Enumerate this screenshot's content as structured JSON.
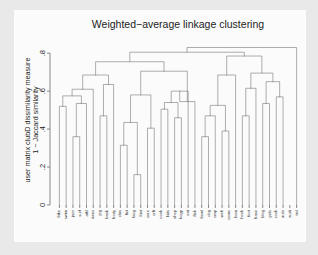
{
  "chart_data": {
    "type": "dendrogram",
    "title": "Weighted−average linkage clustering",
    "xlabel": "",
    "ylabel_line1": "user matrix clubD dissimilarity measure",
    "ylabel_line2": "1 − Jaccard similarity",
    "ylim": [
      0,
      0.88
    ],
    "yticks": [
      0,
      0.2,
      0.4,
      0.6,
      0.8
    ],
    "ytick_labels": [
      "0",
      ".2",
      ".4",
      ".6",
      ".8"
    ],
    "grid": false,
    "legend": "none",
    "leaf_count": 36,
    "leaf_labels": [
      "bike",
      "swim",
      "jazz",
      "surf",
      "athl",
      "danc",
      "jog",
      "bask",
      "body",
      "clas",
      "fict",
      "biog",
      "hist",
      "sore",
      "crft",
      "cook",
      "kids",
      "shop",
      "kogp",
      "eat",
      "fish",
      "bowl",
      "dog",
      "cmp",
      "web",
      "comc",
      "hom",
      "hock",
      "foot",
      "base",
      "blog",
      "polc",
      "rock",
      "auto",
      "audi",
      "trvl"
    ],
    "merges": [
      {
        "id": "m1",
        "left": "bike",
        "right": "swim",
        "height": 0.52
      },
      {
        "id": "m2",
        "left": "jazz",
        "right": "surf",
        "height": 0.36
      },
      {
        "id": "m3",
        "left": "m2",
        "right": "athl",
        "height": 0.535
      },
      {
        "id": "m4",
        "left": "m1",
        "right": "m3",
        "height": 0.575
      },
      {
        "id": "m5",
        "left": "m4",
        "right": "danc",
        "height": 0.61
      },
      {
        "id": "m6",
        "left": "jog",
        "right": "bask",
        "height": 0.47
      },
      {
        "id": "m7",
        "left": "m6",
        "right": "body",
        "height": 0.635
      },
      {
        "id": "m8",
        "left": "m5",
        "right": "m7",
        "height": 0.685
      },
      {
        "id": "m9",
        "left": "clas",
        "right": "fict",
        "height": 0.315
      },
      {
        "id": "m10",
        "left": "biog",
        "right": "hist",
        "height": 0.16
      },
      {
        "id": "m11",
        "left": "m9",
        "right": "m10",
        "height": 0.435
      },
      {
        "id": "m12",
        "left": "sore",
        "right": "crft",
        "height": 0.405
      },
      {
        "id": "m13",
        "left": "m11",
        "right": "m12",
        "height": 0.58
      },
      {
        "id": "m14",
        "left": "cook",
        "right": "kids",
        "height": 0.505
      },
      {
        "id": "m15",
        "left": "shop",
        "right": "kogp",
        "height": 0.46
      },
      {
        "id": "m16",
        "left": "m14",
        "right": "m15",
        "height": 0.54
      },
      {
        "id": "m17",
        "left": "m16",
        "right": "eat",
        "height": 0.6
      },
      {
        "id": "m18",
        "left": "m17",
        "right": "fish",
        "height": 0.545
      },
      {
        "id": "m19",
        "left": "m13",
        "right": "m18",
        "height": 0.705
      },
      {
        "id": "m20",
        "left": "m8",
        "right": "m19",
        "height": 0.755
      },
      {
        "id": "m21",
        "left": "bowl",
        "right": "dog",
        "height": 0.36
      },
      {
        "id": "m22",
        "left": "m21",
        "right": "cmp",
        "height": 0.47
      },
      {
        "id": "m23",
        "left": "web",
        "right": "comc",
        "height": 0.39
      },
      {
        "id": "m24",
        "left": "m22",
        "right": "m23",
        "height": 0.525
      },
      {
        "id": "m25",
        "left": "m24",
        "right": "hom",
        "height": 0.685
      },
      {
        "id": "m26",
        "left": "hock",
        "right": "foot",
        "height": 0.47
      },
      {
        "id": "m27",
        "left": "m26",
        "right": "base",
        "height": 0.615
      },
      {
        "id": "m28",
        "left": "blog",
        "right": "polc",
        "height": 0.535
      },
      {
        "id": "m29",
        "left": "rock",
        "right": "auto",
        "height": 0.57
      },
      {
        "id": "m30",
        "left": "m28",
        "right": "m29",
        "height": 0.65
      },
      {
        "id": "m31",
        "left": "m27",
        "right": "m30",
        "height": 0.695
      },
      {
        "id": "m32",
        "left": "m25",
        "right": "m31",
        "height": 0.785
      },
      {
        "id": "m33",
        "left": "m20",
        "right": "m32",
        "height": 0.805
      },
      {
        "id": "m34",
        "left": "m33",
        "right": "trvl",
        "height": 0.83
      }
    ]
  }
}
